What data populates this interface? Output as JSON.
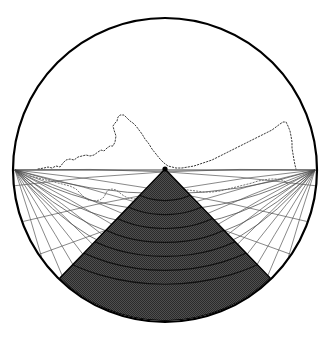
{
  "figure": {
    "title": "Circular fisheye projection diagram",
    "background_color": "#ffffff",
    "canvas": {
      "width": 331,
      "height": 340
    }
  },
  "circle": {
    "name": "outer-circle",
    "center_x": 165,
    "center_y": 170,
    "radius": 152,
    "stroke_color": "#000000",
    "stroke_width": 2.2,
    "fill_color": "#ffffff"
  },
  "horizon": {
    "name": "horizon-line",
    "y": 170,
    "x_start": 13,
    "x_end": 317,
    "stroke_color": "#404040",
    "stroke_width": 1.0
  },
  "apex": {
    "name": "apex-point",
    "x": 165,
    "y": 169,
    "radius": 2.6,
    "color": "#000000"
  },
  "left_node": {
    "x": 15,
    "y": 170
  },
  "right_node": {
    "x": 315,
    "y": 170
  },
  "wedge": {
    "name": "shaded-wedge",
    "fill_color": "#4a4a4a",
    "stipple_color": "#2a2a2a",
    "edge_color": "#000000",
    "edge_width": 1.4,
    "left_edge_x": 50,
    "left_edge_y": 247,
    "right_edge_x": 281,
    "right_edge_y": 247,
    "half_angle_deg": 44,
    "arc_band_count": 7,
    "arc_band_color": "#111111",
    "arc_band_width": 1.2
  },
  "fan_left": {
    "name": "left-fan-lines",
    "origin_x": 15,
    "origin_y": 170,
    "line_count": 11,
    "stroke_color": "#555555",
    "stroke_width": 0.7,
    "angles_deg": [
      3,
      10,
      17,
      24,
      31,
      38,
      45,
      52,
      59,
      66,
      73
    ]
  },
  "fan_right": {
    "name": "right-fan-lines",
    "origin_x": 315,
    "origin_y": 170,
    "line_count": 11,
    "stroke_color": "#555555",
    "stroke_width": 0.7,
    "angles_deg": [
      3,
      10,
      17,
      24,
      31,
      38,
      45,
      52,
      59,
      66,
      73
    ]
  },
  "crossing_curves": {
    "name": "crossing-curves",
    "stroke_color": "#4a4a4a",
    "stroke_width": 0.75,
    "count": 5
  },
  "dotted_outline": {
    "name": "dotted-horizon-profile",
    "stroke_color": "#3a3a3a",
    "stroke_width": 1.0,
    "dash_pattern": "1.4 1.8",
    "points": [
      [
        38,
        169
      ],
      [
        44,
        168
      ],
      [
        48,
        167
      ],
      [
        52,
        168
      ],
      [
        56,
        166
      ],
      [
        60,
        167
      ],
      [
        63,
        163
      ],
      [
        66,
        160
      ],
      [
        70,
        159
      ],
      [
        74,
        160
      ],
      [
        78,
        157
      ],
      [
        82,
        156
      ],
      [
        86,
        155
      ],
      [
        90,
        156
      ],
      [
        94,
        155
      ],
      [
        98,
        152
      ],
      [
        101,
        150
      ],
      [
        104,
        151
      ],
      [
        107,
        148
      ],
      [
        110,
        146
      ],
      [
        113,
        146
      ],
      [
        115,
        142
      ],
      [
        116,
        136
      ],
      [
        114,
        130
      ],
      [
        113,
        126
      ],
      [
        115,
        123
      ],
      [
        117,
        121
      ],
      [
        118,
        117
      ],
      [
        120,
        115
      ],
      [
        124,
        115
      ],
      [
        127,
        118
      ],
      [
        130,
        121
      ],
      [
        133,
        123
      ],
      [
        136,
        126
      ],
      [
        139,
        130
      ],
      [
        142,
        134
      ],
      [
        145,
        139
      ],
      [
        149,
        144
      ],
      [
        152,
        149
      ],
      [
        156,
        154
      ],
      [
        160,
        159
      ],
      [
        164,
        163
      ],
      [
        168,
        166
      ],
      [
        172,
        167
      ],
      [
        176,
        168
      ],
      [
        182,
        168
      ],
      [
        188,
        167
      ],
      [
        194,
        166
      ],
      [
        200,
        164
      ],
      [
        206,
        162
      ],
      [
        212,
        160
      ],
      [
        218,
        157
      ],
      [
        224,
        154
      ],
      [
        230,
        151
      ],
      [
        236,
        148
      ],
      [
        242,
        145
      ],
      [
        248,
        142
      ],
      [
        254,
        139
      ],
      [
        260,
        136
      ],
      [
        266,
        133
      ],
      [
        272,
        130
      ],
      [
        276,
        127
      ],
      [
        280,
        124
      ],
      [
        283,
        122
      ],
      [
        286,
        122
      ],
      [
        288,
        126
      ],
      [
        290,
        131
      ],
      [
        291,
        136
      ],
      [
        292,
        142
      ],
      [
        292,
        148
      ],
      [
        293,
        154
      ],
      [
        294,
        160
      ],
      [
        295,
        165
      ],
      [
        296,
        169
      ]
    ]
  },
  "inner_contour": {
    "name": "inner-contour-dotted",
    "stroke_color": "#555555",
    "stroke_width": 0.8,
    "dash_pattern": "1.3 1.9",
    "points": [
      [
        30,
        176
      ],
      [
        38,
        178
      ],
      [
        46,
        180
      ],
      [
        54,
        182
      ],
      [
        62,
        184
      ],
      [
        70,
        186
      ],
      [
        76,
        189
      ],
      [
        80,
        193
      ],
      [
        84,
        197
      ],
      [
        88,
        200
      ],
      [
        94,
        201
      ],
      [
        100,
        200
      ],
      [
        104,
        197
      ],
      [
        106,
        193
      ],
      [
        108,
        190
      ],
      [
        112,
        189
      ],
      [
        116,
        190
      ],
      [
        120,
        193
      ],
      [
        124,
        196
      ],
      [
        128,
        198
      ],
      [
        134,
        199
      ],
      [
        140,
        198
      ],
      [
        146,
        196
      ],
      [
        152,
        194
      ],
      [
        158,
        192
      ],
      [
        164,
        190
      ],
      [
        172,
        189
      ],
      [
        180,
        189
      ],
      [
        188,
        190
      ],
      [
        196,
        191
      ],
      [
        204,
        192
      ],
      [
        212,
        192
      ],
      [
        220,
        191
      ],
      [
        228,
        189
      ],
      [
        236,
        187
      ],
      [
        244,
        185
      ],
      [
        252,
        183
      ],
      [
        258,
        181
      ],
      [
        264,
        180
      ],
      [
        270,
        179
      ],
      [
        276,
        179
      ],
      [
        282,
        180
      ],
      [
        286,
        182
      ],
      [
        288,
        185
      ]
    ]
  },
  "legend": {
    "shaded_region_label": "",
    "visible_text": []
  }
}
